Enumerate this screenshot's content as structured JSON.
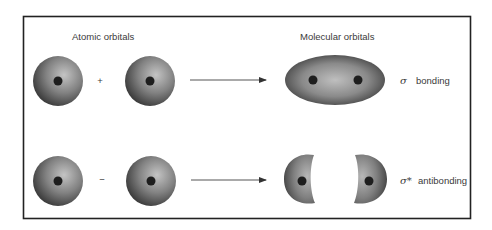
{
  "diagram": {
    "headings": {
      "atomic": "Atomic orbitals",
      "molecular": "Molecular orbitals"
    },
    "rows": [
      {
        "operator": "+",
        "result_symbol": "σ",
        "result_label": "bonding",
        "result_shape": "single-ellipse-two-nuclei"
      },
      {
        "operator": "−",
        "result_symbol": "σ*",
        "result_label": "antibonding",
        "result_shape": "two-separated-lobes"
      }
    ],
    "colors": {
      "orbital_dark": "#3f3f3f",
      "orbital_light": "#bdbdbd",
      "nucleus": "#1e1e1e",
      "border": "#222222",
      "arrow": "#444444"
    }
  }
}
